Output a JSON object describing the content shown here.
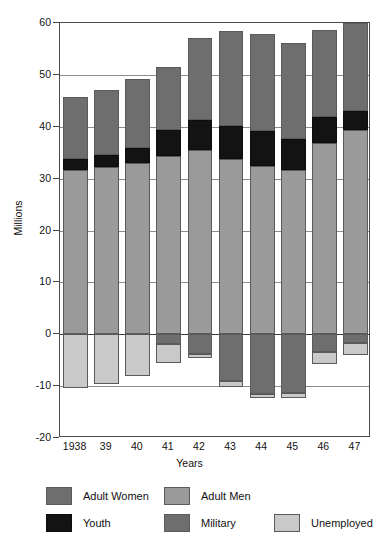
{
  "chart_data": {
    "type": "bar",
    "subtype": "stacked-bar-with-negative",
    "title": "",
    "xlabel": "Years",
    "ylabel": "Millions",
    "ylim": [
      -20,
      60
    ],
    "yticks": [
      60,
      50,
      40,
      30,
      20,
      10,
      0,
      -10,
      -20
    ],
    "ytick_labels": [
      "60",
      "50",
      "40",
      "30",
      "20",
      "10",
      "0",
      "-10",
      "-20"
    ],
    "grid": true,
    "legend_position": "bottom",
    "categories": [
      "1938",
      "39",
      "40",
      "41",
      "42",
      "43",
      "44",
      "45",
      "46",
      "47"
    ],
    "series": [
      {
        "name": "Adult Men",
        "color": "#9a9a9a",
        "direction": "positive",
        "values": [
          31.6,
          32.3,
          33.1,
          34.3,
          35.6,
          33.7,
          32.4,
          31.6,
          36.8,
          39.4
        ]
      },
      {
        "name": "Youth",
        "color": "#131313",
        "direction": "positive",
        "values": [
          2.2,
          2.3,
          2.8,
          5.0,
          5.7,
          6.5,
          6.8,
          6.0,
          5.0,
          3.6
        ]
      },
      {
        "name": "Adult Women",
        "color": "#6e6e6e",
        "direction": "positive",
        "values": [
          11.9,
          12.5,
          13.3,
          12.2,
          15.8,
          18.2,
          18.7,
          18.5,
          16.8,
          17.0
        ]
      },
      {
        "name": "Military",
        "color": "#6e6e6e",
        "direction": "negative",
        "values": [
          0.0,
          0.0,
          0.0,
          1.8,
          3.9,
          9.0,
          11.5,
          11.3,
          3.4,
          1.6
        ]
      },
      {
        "name": "Unemployed",
        "color": "#c9c9c9",
        "direction": "negative",
        "values": [
          10.4,
          9.5,
          8.1,
          3.8,
          0.7,
          1.1,
          0.7,
          1.0,
          2.3,
          2.4
        ]
      }
    ],
    "totals_positive": [
      45.7,
      47.1,
      49.2,
      51.5,
      57.1,
      58.4,
      57.9,
      56.1,
      58.6,
      60.0
    ],
    "totals_negative": [
      10.4,
      9.5,
      8.1,
      5.6,
      4.6,
      10.1,
      12.2,
      12.3,
      5.7,
      4.0
    ]
  },
  "legend": {
    "entries": [
      {
        "label": "Adult Women",
        "swatch": "women"
      },
      {
        "label": "Adult Men",
        "swatch": "men"
      },
      {
        "label": "Youth",
        "swatch": "youth"
      },
      {
        "label": "Military",
        "swatch": "mil"
      },
      {
        "label": "Unemployed",
        "swatch": "unemp"
      }
    ]
  }
}
